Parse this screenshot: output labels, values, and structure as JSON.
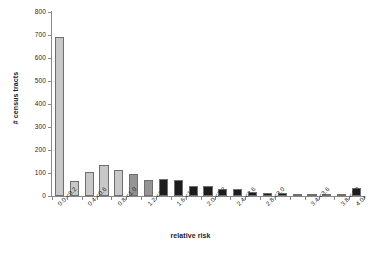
{
  "chart_data": {
    "type": "bar",
    "title": "",
    "subtitle": "",
    "xlabel": "relative risk",
    "ylabel": "# census tracts",
    "ylim": [
      0,
      800
    ],
    "yticks": [
      0,
      100,
      200,
      300,
      400,
      500,
      600,
      700,
      800
    ],
    "ytick_labels": [
      "0",
      "100",
      "200",
      "300",
      "400",
      "500",
      "600",
      "700",
      "800"
    ],
    "grid": false,
    "legend": null,
    "categories": [
      "0.0-<0.2",
      "0.2-<0.4",
      "0.4-<0.6",
      "0.6-<0.8",
      "0.8-<1.0",
      "1.0-<1.2",
      "1.2-<1.4",
      "1.4-<1.6",
      "1.6-<1.8",
      "1.8-<2.0",
      "2.0-<2.2",
      "2.2-<2.4",
      "2.4-<2.6",
      "2.6-<2.8",
      "2.8-<3.0",
      "3.0-<3.2",
      "3.2-<3.4",
      "3.4-<3.6",
      "3.6-<3.8",
      "3.8-<4.0",
      "4.0+"
    ],
    "visible_tick_labels": [
      "0.0-<0.2",
      "",
      "0.4-<0.6",
      "",
      "0.8-<1.0",
      "",
      "1.2-<1.4",
      "",
      "1.6-<1.8",
      "",
      "2.0-<2.2",
      "",
      "2.4-<2.6",
      "",
      "2.8-<3.0",
      "",
      "",
      "3.4-<3.6",
      "",
      "3.8-<4.0",
      "4.0+"
    ],
    "values": [
      690,
      65,
      103,
      137,
      114,
      96,
      68,
      75,
      68,
      45,
      43,
      31,
      29,
      18,
      14,
      13,
      9,
      8,
      5,
      3,
      35
    ],
    "bar_colors": [
      "#c8c8c8",
      "#c8c8c8",
      "#c8c8c8",
      "#c8c8c8",
      "#c8c8c8",
      "#949494",
      "#949494",
      "#1c1c1c",
      "#1c1c1c",
      "#1c1c1c",
      "#1c1c1c",
      "#1c1c1c",
      "#1c1c1c",
      "#1c1c1c",
      "#1c1c1c",
      "#1c1c1c",
      "#1c1c1c",
      "#1c1c1c",
      "#1c1c1c",
      "#1c1c1c",
      "#1c1c1c"
    ],
    "bar_edge_color": "#6f6f6f",
    "axis_color": "#8a8a8a",
    "text_color": "#1b1b1b"
  }
}
